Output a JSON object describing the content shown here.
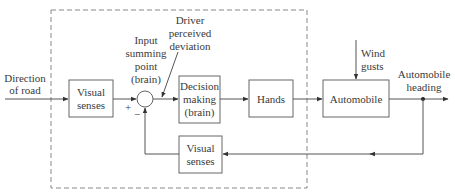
{
  "diagram": {
    "type": "block-diagram",
    "input": {
      "label_line1": "Direction",
      "label_line2": "of road"
    },
    "blocks": {
      "visual_senses_forward": {
        "line1": "Visual",
        "line2": "senses"
      },
      "decision": {
        "line1": "Decision",
        "line2": "making",
        "line3": "(brain)"
      },
      "hands": {
        "line1": "Hands"
      },
      "automobile": {
        "line1": "Automobile"
      },
      "visual_senses_feedback": {
        "line1": "Visual",
        "line2": "senses"
      }
    },
    "summing_point": {
      "label_line1": "Input",
      "label_line2": "summing",
      "label_line3": "point",
      "label_line4": "(brain)",
      "plus_sign": "+",
      "minus_sign": "−"
    },
    "deviation": {
      "line1": "Driver",
      "line2": "perceived",
      "line3": "deviation"
    },
    "disturbance": {
      "line1": "Wind",
      "line2": "gusts"
    },
    "output": {
      "line1": "Automobile",
      "line2": "heading"
    },
    "colors": {
      "line": "#555555",
      "box_border": "#666666",
      "text": "#3a3a3a",
      "dashed_boundary": "#888888"
    }
  }
}
